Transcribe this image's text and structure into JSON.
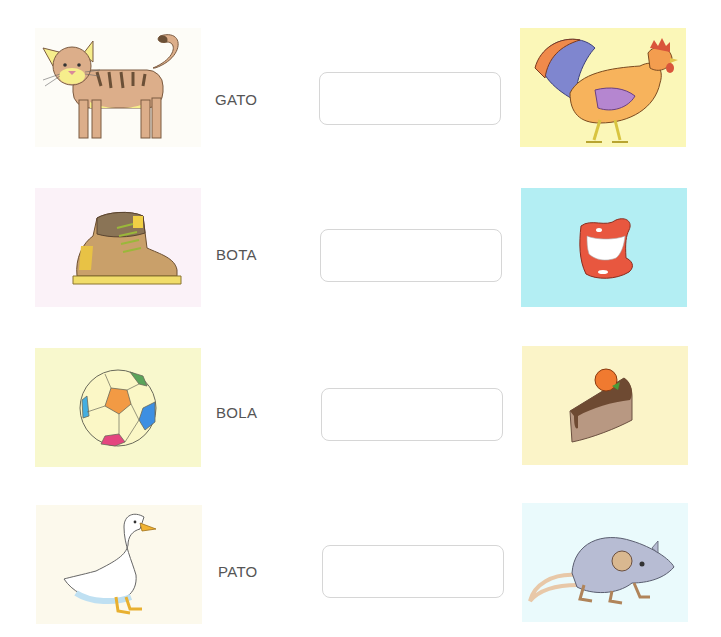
{
  "worksheet": {
    "rows": [
      {
        "word": "GATO",
        "left_image": {
          "icon": "cat-icon",
          "subject": "cat",
          "background": "#fdfcf7"
        },
        "answer_value": "",
        "right_image": {
          "icon": "rooster-icon",
          "subject": "rooster",
          "background": "#fbf7b8"
        }
      },
      {
        "word": "BOTA",
        "left_image": {
          "icon": "boot-icon",
          "subject": "boot",
          "background": "#fbf2f8"
        },
        "answer_value": "",
        "right_image": {
          "icon": "mouth-icon",
          "subject": "mouth",
          "background": "#b3eef3"
        }
      },
      {
        "word": "BOLA",
        "left_image": {
          "icon": "ball-icon",
          "subject": "ball",
          "background": "#f8f8cd"
        },
        "answer_value": "",
        "right_image": {
          "icon": "cake-icon",
          "subject": "cake",
          "background": "#fbf4c8"
        }
      },
      {
        "word": "PATO",
        "left_image": {
          "icon": "duck-icon",
          "subject": "duck",
          "background": "#fcf9ec"
        },
        "answer_value": "",
        "right_image": {
          "icon": "mouse-icon",
          "subject": "mouse",
          "background": "#eafafc"
        }
      }
    ]
  }
}
